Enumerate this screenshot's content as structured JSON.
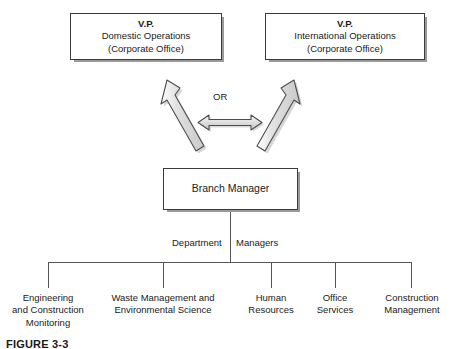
{
  "figure": {
    "caption": "FIGURE 3-3"
  },
  "diagram": {
    "type": "organizational-chart",
    "or_label": "OR",
    "department_label_left": "Department",
    "department_label_right": "Managers",
    "top_nodes": [
      {
        "id": "vp-domestic",
        "lines": [
          "V.P.",
          "Domestic Operations",
          "(Corporate Office)"
        ],
        "bold_first_line": true
      },
      {
        "id": "vp-international",
        "lines": [
          "V.P.",
          "International Operations",
          "(Corporate Office)"
        ],
        "bold_first_line": true
      }
    ],
    "middle_node": {
      "id": "branch-manager",
      "lines": [
        "Branch Manager"
      ],
      "bold_first_line": false
    },
    "leaf_nodes": [
      {
        "id": "engineering-construction-monitoring",
        "lines": [
          "Engineering",
          "and Construction",
          "Monitoring"
        ]
      },
      {
        "id": "waste-management-environmental-science",
        "lines": [
          "Waste Management and",
          "Environmental Science"
        ]
      },
      {
        "id": "human-resources",
        "lines": [
          "Human",
          "Resources"
        ]
      },
      {
        "id": "office-services",
        "lines": [
          "Office",
          "Services"
        ]
      },
      {
        "id": "construction-management",
        "lines": [
          "Construction",
          "Management"
        ]
      }
    ],
    "colors": {
      "background": "#ffffff",
      "box_border": "#3a3a3a",
      "box_fill": "#ffffff",
      "box_shadow": "#9a9a9a",
      "arrow_fill": "#d9d9d9",
      "arrow_stroke": "#4d4d4d",
      "line": "#555555",
      "text": "#1a1a1a"
    }
  }
}
